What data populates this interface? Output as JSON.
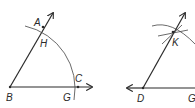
{
  "figure_left": {
    "labels": {
      "A": "A",
      "H": "H",
      "B": "B",
      "G": "G",
      "C": "C"
    }
  },
  "figure_right": {
    "labels": {
      "K": "K",
      "D": "D",
      "G": "G"
    }
  },
  "colors": {
    "line": "#2a2a2a",
    "arc": "#444444",
    "background": "#ffffff"
  }
}
